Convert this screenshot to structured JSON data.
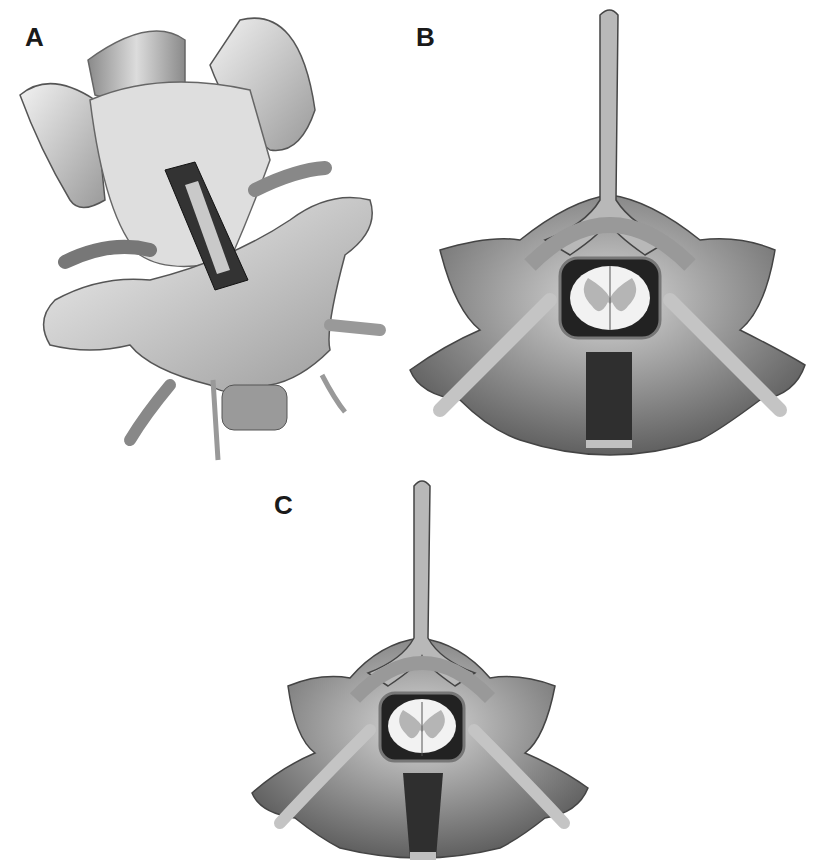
{
  "figure": {
    "panels": [
      {
        "id": "A",
        "label": "A",
        "description": "Oblique 3D view of two vertebrae with rectangular implant/graft between vertebral bodies and exiting nerve roots"
      },
      {
        "id": "B",
        "label": "B",
        "description": "Axial view of vertebra with spinal cord (butterfly gray matter) and rectangular graft in vertebral body"
      },
      {
        "id": "C",
        "label": "C",
        "description": "Axial view of vertebra with spinal cord and trapezoidal (tapered) graft in vertebral body"
      }
    ],
    "colors": {
      "bone_light": "#e6e6e6",
      "bone_mid": "#a8a8a8",
      "bone_dark": "#5e5e5e",
      "graft": "#2f2f2f",
      "cord_white": "#f2f2f2",
      "cord_gray": "#b5b5b5",
      "background": "#ffffff"
    }
  }
}
